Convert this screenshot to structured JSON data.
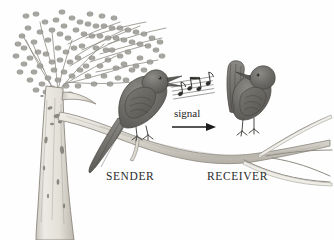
{
  "figure": {
    "medium": "pencil illustration",
    "background_color": "#fefefe",
    "ink_color": "#555555",
    "width": 334,
    "height": 240
  },
  "labels": {
    "sender": "SENDER",
    "receiver": "RECEIVER",
    "signal": "signal"
  },
  "elements": {
    "tree": {
      "name": "tree-with-foliage",
      "trunk_color": "#d9d6cf",
      "foliage_color": "#9a9a96",
      "description": "Broad trunk at left rising into dense stippled canopy"
    },
    "branch": {
      "name": "horizontal-branch",
      "color": "#cfcbc3",
      "description": "Long branch sloping down to the right, forking into thin twigs"
    },
    "sender_bird": {
      "name": "sender-bird",
      "body_color": "#6f6d69",
      "facing": "right",
      "beak": "open",
      "tail": "long, angled down-left"
    },
    "receiver_bird": {
      "name": "receiver-bird",
      "body_color": "#6f6d69",
      "facing": "left",
      "beak": "closed",
      "tail": "cocked upright"
    },
    "music_staff": {
      "name": "music-notes-staff",
      "line_count": 5,
      "note_count": 4,
      "color": "#4a4a4a",
      "description": "Tilted musical staff with eighth notes emanating from the sender's beak"
    },
    "arrow": {
      "name": "signal-arrow",
      "direction": "right",
      "color": "#1c1c1c"
    }
  }
}
